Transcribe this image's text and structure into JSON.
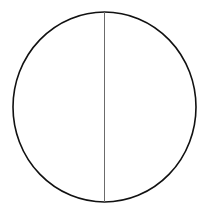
{
  "diagram": {
    "shape": "circle-divided-by-vertical-diameter",
    "circle": {
      "cx": 104.5,
      "cy": 107,
      "rx": 91.5,
      "ry": 95,
      "stroke": "#111111",
      "stroke_width": 1.6,
      "fill": "#ffffff"
    },
    "divider": {
      "x": 104.5,
      "y1": 12,
      "y2": 202,
      "stroke": "#6b6b6b",
      "stroke_width": 1
    },
    "regions": [
      {
        "name": "left-half",
        "label": ""
      },
      {
        "name": "right-half",
        "label": ""
      }
    ]
  }
}
